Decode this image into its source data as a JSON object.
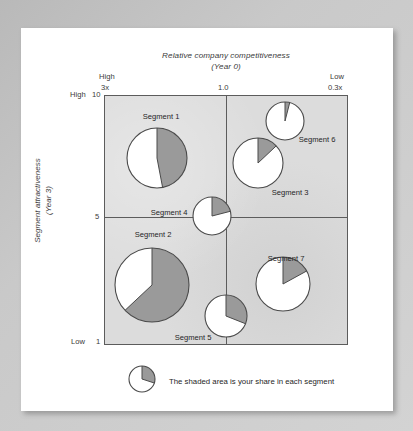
{
  "chart_data": {
    "type": "pie",
    "title": "Relative company competitiveness",
    "subtitle": "(Year 0)",
    "xlabel": "Relative company competitiveness (Year 0)",
    "ylabel": "Segment attractiveness (Year 3)",
    "ylabel_line1": "Segment attractiveness",
    "ylabel_line2": "(Year 3)",
    "grid": true,
    "legend": "The shaded area is your share in each segment",
    "legend_position": "below-plot",
    "legend_share_pct": 30,
    "x_axis": {
      "left_qualifier": "High",
      "left_tick": "3x",
      "mid_tick": "1.0",
      "right_qualifier": "Low",
      "right_tick": "0.3x",
      "ticks": [
        "3x",
        "1.0",
        "0.3x"
      ]
    },
    "y_axis": {
      "top_qualifier": "High",
      "top_tick": "10",
      "mid_tick": "5",
      "bottom_qualifier": "Low",
      "bottom_tick": "1",
      "ticks": [
        "10",
        "5",
        "1"
      ]
    },
    "colors": {
      "shaded": "#9a9a9a",
      "unshaded": "#ffffff",
      "plot_background": "#dcdcdc",
      "axis": "#5c5c5c"
    },
    "points": [
      {
        "label": "Segment 1",
        "x_competitiveness": "2.3x",
        "y_attractiveness": 8.7,
        "share_pct": 47,
        "bubble_radius_px": 30,
        "px": {
          "cx": 52,
          "cy": 62
        },
        "label_px": {
          "x": 56,
          "y": 20
        }
      },
      {
        "label": "Segment 2",
        "x_competitiveness": "2.3x",
        "y_attractiveness": 3.2,
        "share_pct": 63,
        "bubble_radius_px": 37,
        "px": {
          "cx": 47,
          "cy": 189
        },
        "label_px": {
          "x": 48,
          "y": 138
        }
      },
      {
        "label": "Segment 3",
        "x_competitiveness": "0.75x",
        "y_attractiveness": 7.4,
        "share_pct": 13,
        "bubble_radius_px": 25,
        "px": {
          "cx": 153,
          "cy": 67
        },
        "label_px": {
          "x": 185,
          "y": 96
        }
      },
      {
        "label": "Segment 4",
        "x_competitiveness": "1.0",
        "y_attractiveness": 5.0,
        "share_pct": 21,
        "bubble_radius_px": 19,
        "px": {
          "cx": 107,
          "cy": 120
        },
        "label_px": {
          "x": 64,
          "y": 116
        }
      },
      {
        "label": "Segment 5",
        "x_competitiveness": "1.0",
        "y_attractiveness": 1.6,
        "share_pct": 31,
        "bubble_radius_px": 21,
        "px": {
          "cx": 121,
          "cy": 220
        },
        "label_px": {
          "x": 88,
          "y": 241
        }
      },
      {
        "label": "Segment 6",
        "x_competitiveness": "0.5x",
        "y_attractiveness": 9.2,
        "share_pct": 4,
        "bubble_radius_px": 19,
        "px": {
          "cx": 180,
          "cy": 25
        },
        "label_px": {
          "x": 212,
          "y": 43
        }
      },
      {
        "label": "Segment 7",
        "x_competitiveness": "0.55x",
        "y_attractiveness": 2.7,
        "share_pct": 17,
        "bubble_radius_px": 27,
        "px": {
          "cx": 178,
          "cy": 188
        },
        "label_px": {
          "x": 181,
          "y": 162
        }
      }
    ]
  }
}
